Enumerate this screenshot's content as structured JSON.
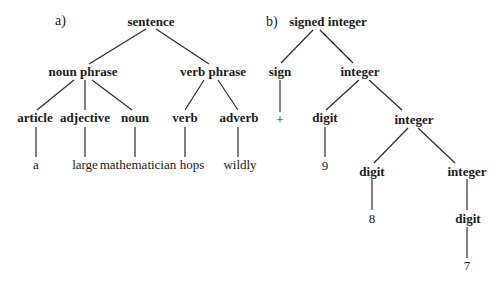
{
  "diagram_a": {
    "label": "a)",
    "nodes": {
      "sentence": "sentence",
      "noun_phrase": "noun phrase",
      "verb_phrase": "verb phrase",
      "article": "article",
      "adjective": "adjective",
      "noun": "noun",
      "verb": "verb",
      "adverb": "adverb",
      "leaf_a": "a",
      "leaf_large": "large",
      "leaf_mathematician": "mathematician",
      "leaf_hops": "hops",
      "leaf_wildly": "wildly"
    },
    "edges": [
      [
        "sentence",
        "noun phrase"
      ],
      [
        "sentence",
        "verb phrase"
      ],
      [
        "noun phrase",
        "article"
      ],
      [
        "noun phrase",
        "adjective"
      ],
      [
        "noun phrase",
        "noun"
      ],
      [
        "verb phrase",
        "verb"
      ],
      [
        "verb phrase",
        "adverb"
      ],
      [
        "article",
        "a"
      ],
      [
        "adjective",
        "large"
      ],
      [
        "noun",
        "mathematician"
      ],
      [
        "verb",
        "hops"
      ],
      [
        "adverb",
        "wildly"
      ]
    ]
  },
  "diagram_b": {
    "label": "b)",
    "nodes": {
      "signed_integer": "signed integer",
      "sign": "sign",
      "integer_1": "integer",
      "plus": "+",
      "digit_1": "digit",
      "integer_2": "integer",
      "leaf_9": "9",
      "digit_2": "digit",
      "integer_3": "integer",
      "leaf_8": "8",
      "digit_3": "digit",
      "leaf_7": "7"
    },
    "edges": [
      [
        "signed integer",
        "sign"
      ],
      [
        "signed integer",
        "integer"
      ],
      [
        "sign",
        "+"
      ],
      [
        "integer",
        "digit"
      ],
      [
        "integer",
        "integer"
      ],
      [
        "digit",
        "9"
      ],
      [
        "integer",
        "digit"
      ],
      [
        "integer",
        "integer"
      ],
      [
        "digit",
        "8"
      ],
      [
        "integer",
        "digit"
      ],
      [
        "digit",
        "7"
      ]
    ]
  }
}
